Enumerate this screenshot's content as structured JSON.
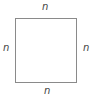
{
  "diagram": {
    "shape": "square",
    "labels": {
      "top": "n",
      "bottom": "n",
      "left": "n",
      "right": "n"
    },
    "colors": {
      "stroke": "#8a8a8a",
      "text": "#444444",
      "background": "#ffffff"
    }
  }
}
